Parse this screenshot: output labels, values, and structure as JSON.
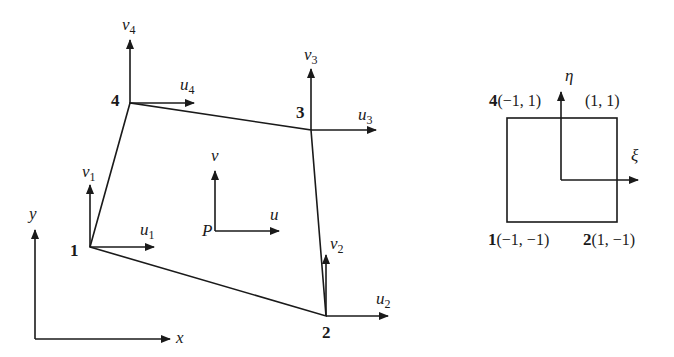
{
  "diagram": {
    "physical_element": {
      "nodes": [
        {
          "id": "1",
          "label": "1",
          "u_label": "u",
          "u_sub": "1",
          "v_label": "v",
          "v_sub": "1"
        },
        {
          "id": "2",
          "label": "2",
          "u_label": "u",
          "u_sub": "2",
          "v_label": "v",
          "v_sub": "2"
        },
        {
          "id": "3",
          "label": "3",
          "u_label": "u",
          "u_sub": "3",
          "v_label": "v",
          "v_sub": "3"
        },
        {
          "id": "4",
          "label": "4",
          "u_label": "u",
          "u_sub": "4",
          "v_label": "v",
          "v_sub": "4"
        }
      ],
      "interior_point": {
        "label": "P",
        "u_label": "u",
        "v_label": "v"
      },
      "global_axes": {
        "x_label": "x",
        "y_label": "y"
      }
    },
    "natural_element": {
      "xi_label": "ξ",
      "eta_label": "η",
      "corners": [
        {
          "node": "1",
          "coords": "(−1, −1)"
        },
        {
          "node": "2",
          "coords": "(1, −1)"
        },
        {
          "node": "",
          "coords": "(1, 1)"
        },
        {
          "node": "4",
          "coords": "(−1, 1)"
        }
      ]
    },
    "colors": {
      "ink": "#1a1a1a",
      "background": "#ffffff"
    }
  }
}
